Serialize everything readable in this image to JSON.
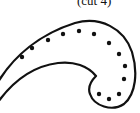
{
  "figure": {
    "caption": "(cut 4)",
    "stroke_color": "#111111",
    "dot_color": "#111111",
    "dot_count": 13,
    "dots": [
      [
        22,
        57
      ],
      [
        32,
        48
      ],
      [
        48,
        40
      ],
      [
        63,
        34
      ],
      [
        79,
        31
      ],
      [
        94,
        34
      ],
      [
        109,
        43
      ],
      [
        119,
        54
      ],
      [
        125,
        66
      ],
      [
        124,
        79
      ],
      [
        119,
        94
      ],
      [
        109,
        99
      ],
      [
        99,
        94
      ]
    ]
  }
}
